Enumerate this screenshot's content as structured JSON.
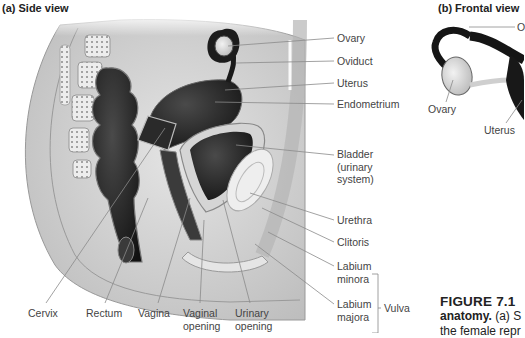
{
  "panels": {
    "a_title": "(a) Side view",
    "b_title": "(b) Frontal view"
  },
  "side_view": {
    "right_labels": [
      {
        "text": "Ovary"
      },
      {
        "text": "Oviduct"
      },
      {
        "text": "Uterus"
      },
      {
        "text": "Endometrium"
      },
      {
        "text": "Bladder (urinary system)"
      },
      {
        "text": "Urethra"
      },
      {
        "text": "Clitoris"
      },
      {
        "text": "Labium minora"
      },
      {
        "text": "Labium majora"
      }
    ],
    "bottom_labels": [
      {
        "text": "Cervix"
      },
      {
        "text": "Rectum"
      },
      {
        "text": "Vagina"
      },
      {
        "text": "Vaginal opening"
      },
      {
        "text": "Urinary opening"
      }
    ],
    "group_label": "Vulva"
  },
  "frontal_view": {
    "labels": [
      {
        "text": "O"
      },
      {
        "text": "Ovary"
      },
      {
        "text": "Uterus"
      }
    ]
  },
  "caption": {
    "figure_number": "FIGURE 7.1",
    "line1_bold": "anatomy.",
    "line1_rest": "(a) S",
    "line2": "the female repr"
  },
  "colors": {
    "organ_dark": "#1e1e1e",
    "tissue_light": "#dcdcdc",
    "bone": "#e8e8e8",
    "leader_line": "#8a8a8a",
    "label_text": "#444444"
  }
}
